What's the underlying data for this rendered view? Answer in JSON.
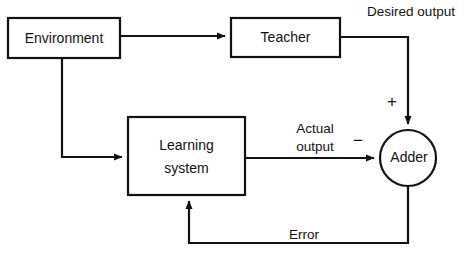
{
  "diagram": {
    "canvas": {
      "width": 474,
      "height": 262,
      "background": "#ffffff"
    },
    "line_color": "#111111",
    "nodes": [
      {
        "id": "environment",
        "label": "Environment",
        "shape": "rectangle",
        "x": 8,
        "y": 18,
        "width": 112,
        "height": 40
      },
      {
        "id": "teacher",
        "label": "Teacher",
        "shape": "rectangle",
        "x": 231,
        "y": 18,
        "width": 109,
        "height": 39
      },
      {
        "id": "learning_system",
        "label_line1": "Learning",
        "label_line2": "system",
        "shape": "rectangle",
        "x": 128,
        "y": 117,
        "width": 117,
        "height": 78
      },
      {
        "id": "adder",
        "label": "Adder",
        "shape": "circle",
        "cx": 408,
        "cy": 158,
        "r": 28
      }
    ],
    "edge_labels": {
      "desired_output": "Desired output",
      "actual_output_line1": "Actual",
      "actual_output_line2": "output",
      "error": "Error",
      "plus_sign": "+",
      "minus_sign": "−"
    },
    "edges": [
      {
        "id": "environment-to-teacher",
        "from": "environment",
        "to": "teacher",
        "label": ""
      },
      {
        "id": "environment-to-learning-system",
        "from": "environment",
        "to": "learning_system",
        "label": ""
      },
      {
        "id": "teacher-to-adder",
        "from": "teacher",
        "to": "adder",
        "label": "Desired output",
        "sign": "+"
      },
      {
        "id": "learning-system-to-adder",
        "from": "learning_system",
        "to": "adder",
        "label": "Actual output",
        "sign": "−"
      },
      {
        "id": "adder-to-learning-system",
        "from": "adder",
        "to": "learning_system",
        "label": "Error"
      }
    ]
  }
}
